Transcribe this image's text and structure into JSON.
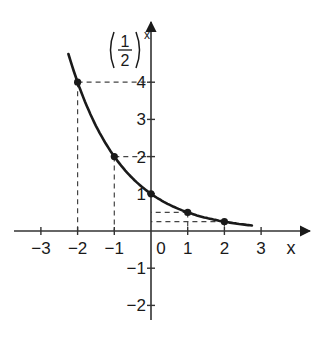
{
  "chart_data": {
    "type": "line",
    "title": "",
    "function_label": {
      "numerator": "1",
      "denominator": "2",
      "exponent": "x"
    },
    "xlabel": "x",
    "ylabel": "(1/2)^x",
    "xlim": [
      -3.5,
      4.3
    ],
    "ylim": [
      -2.5,
      5.0
    ],
    "grid": false,
    "x_ticks": [
      {
        "value": -3,
        "label": "−3"
      },
      {
        "value": -2,
        "label": "−2"
      },
      {
        "value": -1,
        "label": "−1"
      },
      {
        "value": 0,
        "label": "0"
      },
      {
        "value": 1,
        "label": "1"
      },
      {
        "value": 2,
        "label": "2"
      },
      {
        "value": 3,
        "label": "3"
      }
    ],
    "y_ticks": [
      {
        "value": 4,
        "label": "4"
      },
      {
        "value": 3,
        "label": "3"
      },
      {
        "value": 2,
        "label": "2"
      },
      {
        "value": 1,
        "label": "1"
      },
      {
        "value": -1,
        "label": "−1"
      },
      {
        "value": -2,
        "label": "−2"
      }
    ],
    "series": [
      {
        "name": "(1/2)^x",
        "x_range": [
          -2.25,
          2.75
        ],
        "points": [
          {
            "x": -2,
            "y": 4
          },
          {
            "x": -1,
            "y": 2
          },
          {
            "x": 0,
            "y": 1
          },
          {
            "x": 1,
            "y": 0.5
          },
          {
            "x": 2,
            "y": 0.25
          }
        ]
      }
    ],
    "guides": "dashed projections from each marked point to both axes",
    "colors": {
      "curve": "#1a1a1a",
      "axes": "#333333",
      "guides": "#444444"
    }
  }
}
